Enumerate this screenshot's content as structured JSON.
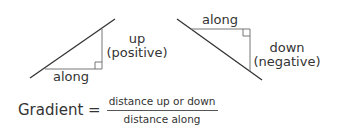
{
  "diagram": {
    "positive": {
      "horizontal_label": "along",
      "vertical_label_line1": "up",
      "vertical_label_line2": "(positive)"
    },
    "negative": {
      "horizontal_label": "along",
      "vertical_label_line1": "down",
      "vertical_label_line2": "(negative)"
    },
    "formula": {
      "lhs": "Gradient =",
      "numerator": "distance up or down",
      "denominator": "distance along"
    },
    "colors": {
      "line": "#333333",
      "triangle_edge": "#777777",
      "text": "#333333"
    }
  }
}
